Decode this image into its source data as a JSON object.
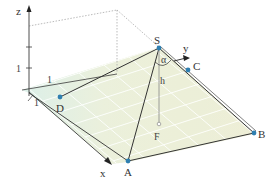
{
  "figure": {
    "type": "3d-pyramid-coordinate-diagram",
    "axes": {
      "x": "x",
      "y": "y",
      "z": "z",
      "unit_labels": {
        "z": "1",
        "y": "1",
        "x": "1"
      }
    },
    "points": {
      "S": "S",
      "A": "A",
      "B": "B",
      "C": "C",
      "D": "D",
      "F": "F"
    },
    "labels": {
      "height": "h",
      "angle": "α"
    },
    "colors": {
      "base_fill": "#eef0da",
      "grid_fill_strip": "#dff1ec",
      "grid_line": "#ffffff",
      "edge": "#3a3a3a",
      "point": "#2f7fb0",
      "dotted": "#aaaaaa"
    }
  }
}
